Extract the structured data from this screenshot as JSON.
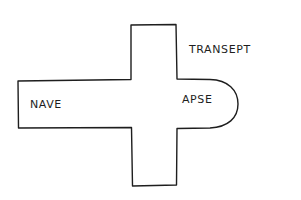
{
  "diagram": {
    "type": "church-floor-plan",
    "shape": "latin-cross",
    "labels": {
      "nave": "NAVE",
      "apse": "APSE",
      "transept": "TRANSEPT"
    },
    "colors": {
      "line": "#1e1e1e",
      "background": "#ffffff"
    }
  }
}
